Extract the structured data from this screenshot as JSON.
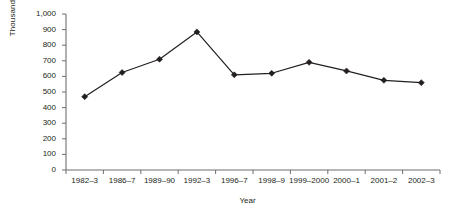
{
  "chart_data": {
    "type": "line",
    "title": "",
    "xlabel": "Year",
    "ylabel": "Thousands",
    "categories": [
      "1982–3",
      "1986–7",
      "1989–90",
      "1992–3",
      "1996–7",
      "1998–9",
      "1999–2000",
      "2000–1",
      "2001–2",
      "2002–3"
    ],
    "values": [
      470,
      625,
      710,
      885,
      610,
      620,
      690,
      635,
      575,
      560
    ],
    "series": [
      {
        "name": "Thousands",
        "values": [
          470,
          625,
          710,
          885,
          610,
          620,
          690,
          635,
          575,
          560
        ]
      }
    ],
    "ylim": [
      0,
      1000
    ],
    "ytick_values": [
      0,
      100,
      200,
      300,
      400,
      500,
      600,
      700,
      800,
      900,
      1000
    ],
    "ytick_labels": [
      "0",
      "100",
      "200",
      "300",
      "400",
      "500",
      "600",
      "700",
      "800",
      "900",
      "1,000"
    ],
    "grid": false,
    "legend": "none",
    "marker": "diamond",
    "line_color": "#231f20",
    "marker_color": "#231f20",
    "background_color": "#ffffff"
  },
  "axes": {
    "y_title": "Thousands",
    "x_title": "Year"
  }
}
